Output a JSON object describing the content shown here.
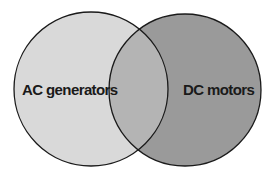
{
  "diagram": {
    "type": "venn",
    "sets": [
      {
        "label": "AC generators",
        "fill": "#d9d9d9"
      },
      {
        "label": "DC motors",
        "fill": "#9a9a9a"
      }
    ],
    "overlap_fill": "#b4b4b4",
    "stroke": "#1a1a1a"
  }
}
